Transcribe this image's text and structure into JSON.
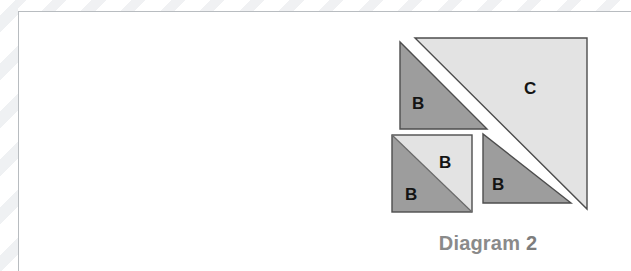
{
  "figure": {
    "caption": "Diagram 2",
    "caption_text": "Diagram",
    "caption_number": "2",
    "colors": {
      "dark_fabric": "#9d9d9d",
      "light_fabric": "#e3e3e3",
      "outline": "#4d4d4d",
      "caption_text": "#8a8a8a",
      "frame_rule": "#b8bcc0",
      "page_background": "#ffffff"
    },
    "pieces": [
      {
        "id": "piece-b-top-left",
        "label": "B",
        "shade": "dark",
        "shape": "right-triangle",
        "right_angle_corner": "bottom-left"
      },
      {
        "id": "piece-c-large",
        "label": "C",
        "shade": "light",
        "shape": "right-triangle",
        "right_angle_corner": "top-right"
      },
      {
        "id": "piece-b-square-upper",
        "label": "B",
        "shade": "light",
        "shape": "half-square-triangle",
        "right_angle_corner": "top-right"
      },
      {
        "id": "piece-b-square-lower",
        "label": "B",
        "shade": "dark",
        "shape": "half-square-triangle",
        "right_angle_corner": "bottom-left"
      },
      {
        "id": "piece-b-right",
        "label": "B",
        "shade": "dark",
        "shape": "right-triangle",
        "right_angle_corner": "bottom-left"
      }
    ]
  }
}
